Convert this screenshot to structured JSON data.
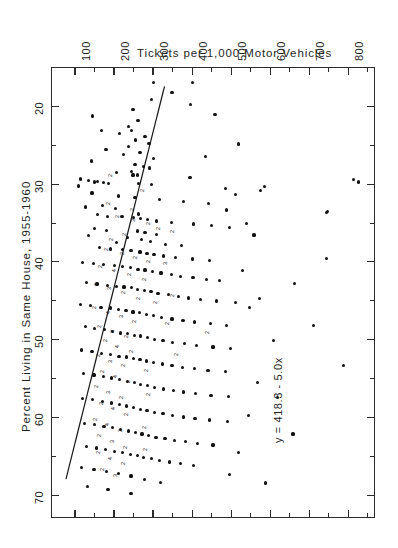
{
  "figure": {
    "orientation": "rotated-90",
    "background_color": "#ffffff",
    "ink_color": "#111111"
  },
  "chart_data": {
    "type": "scatter",
    "title": "Tickets per 1,000 Motor Vehicles",
    "xlabel": "Percent Living in Same House, 1955-1960",
    "ylabel": "Tickets per 1,000 Motor Vehicles",
    "annotation": "y = 418.3 - 5.0x",
    "grid": false,
    "legend": null,
    "xlim": [
      15,
      73
    ],
    "ylim": [
      40,
      870
    ],
    "x_ticks": [
      20,
      30,
      40,
      50,
      60,
      70
    ],
    "x_tick_labels": [
      "20",
      "30",
      "40",
      "50",
      "60",
      "70"
    ],
    "y_ticks": [
      100,
      200,
      300,
      400,
      500,
      600,
      700,
      800
    ],
    "y_tick_labels": [
      "100",
      "200",
      "300",
      "400",
      "500",
      "600",
      "700",
      "800"
    ],
    "minor_ticks_y": [
      150,
      250,
      350,
      450,
      550,
      650,
      750,
      850
    ],
    "regression": {
      "equation": "y = 418.3 - 5.0x",
      "intercept": 418.3,
      "slope": -5.0,
      "x_start": 17.5,
      "x_end": 68.0
    },
    "points": [
      [
        17.0,
        303
      ],
      [
        17.0,
        403
      ],
      [
        18.3,
        350
      ],
      [
        19.2,
        297
      ],
      [
        19.8,
        398
      ],
      [
        20.5,
        250
      ],
      [
        21.3,
        147
      ],
      [
        21.9,
        263
      ],
      [
        22.6,
        238
      ],
      [
        23.2,
        170
      ],
      [
        23.2,
        247
      ],
      [
        23.6,
        215
      ],
      [
        23.9,
        281
      ],
      [
        24.4,
        256
      ],
      [
        24.8,
        291
      ],
      [
        25.2,
        238
      ],
      [
        25.6,
        181
      ],
      [
        26.0,
        268
      ],
      [
        26.3,
        225
      ],
      [
        26.8,
        303
      ],
      [
        27.1,
        143
      ],
      [
        27.5,
        255
      ],
      [
        27.8,
        278
      ],
      [
        28.0,
        292
      ],
      [
        28.4,
        247
      ],
      [
        28.6,
        207
      ],
      [
        28.9,
        250
      ],
      [
        28.9,
        262
      ],
      [
        29.2,
        396
      ],
      [
        29.4,
        116
      ],
      [
        29.6,
        136
      ],
      [
        29.7,
        160
      ],
      [
        29.8,
        151
      ],
      [
        29.9,
        174
      ],
      [
        30.0,
        188
      ],
      [
        30.0,
        264
      ],
      [
        30.1,
        298
      ],
      [
        30.3,
        110
      ],
      [
        30.6,
        486
      ],
      [
        30.9,
        576
      ],
      [
        31.2,
        145
      ],
      [
        31.6,
        213
      ],
      [
        31.8,
        255
      ],
      [
        32.0,
        318
      ],
      [
        32.3,
        380
      ],
      [
        32.6,
        444
      ],
      [
        32.8,
        172
      ],
      [
        33.0,
        128
      ],
      [
        33.2,
        205
      ],
      [
        33.4,
        490
      ],
      [
        33.7,
        745
      ],
      [
        33.9,
        265
      ],
      [
        34.0,
        160
      ],
      [
        34.2,
        185
      ],
      [
        34.2,
        222
      ],
      [
        34.4,
        252
      ],
      [
        34.5,
        269
      ],
      [
        34.6,
        288
      ],
      [
        34.8,
        311
      ],
      [
        35.0,
        348
      ],
      [
        35.2,
        405
      ],
      [
        35.4,
        452
      ],
      [
        35.6,
        498
      ],
      [
        35.8,
        152
      ],
      [
        36.0,
        182
      ],
      [
        36.1,
        262
      ],
      [
        36.3,
        281
      ],
      [
        36.5,
        310
      ],
      [
        36.7,
        137
      ],
      [
        36.9,
        237
      ],
      [
        37.2,
        271
      ],
      [
        37.4,
        295
      ],
      [
        37.6,
        208
      ],
      [
        37.8,
        333
      ],
      [
        38.0,
        375
      ],
      [
        38.2,
        165
      ],
      [
        38.4,
        193
      ],
      [
        38.5,
        224
      ],
      [
        38.6,
        245
      ],
      [
        38.8,
        268
      ],
      [
        39.0,
        286
      ],
      [
        39.1,
        304
      ],
      [
        39.3,
        329
      ],
      [
        39.5,
        358
      ],
      [
        39.7,
        402
      ],
      [
        39.9,
        447
      ],
      [
        40.1,
        121
      ],
      [
        40.3,
        148
      ],
      [
        40.4,
        175
      ],
      [
        40.5,
        202
      ],
      [
        40.7,
        223
      ],
      [
        40.8,
        244
      ],
      [
        41.0,
        263
      ],
      [
        41.1,
        281
      ],
      [
        41.3,
        300
      ],
      [
        41.5,
        322
      ],
      [
        41.7,
        348
      ],
      [
        41.9,
        371
      ],
      [
        42.1,
        404
      ],
      [
        42.3,
        438
      ],
      [
        42.5,
        471
      ],
      [
        42.7,
        131
      ],
      [
        42.9,
        158
      ],
      [
        43.1,
        184
      ],
      [
        43.2,
        208
      ],
      [
        43.3,
        227
      ],
      [
        43.4,
        246
      ],
      [
        43.6,
        262
      ],
      [
        43.7,
        279
      ],
      [
        43.9,
        296
      ],
      [
        44.1,
        314
      ],
      [
        44.3,
        340
      ],
      [
        44.5,
        366
      ],
      [
        44.7,
        392
      ],
      [
        44.9,
        424
      ],
      [
        45.1,
        463
      ],
      [
        45.3,
        512
      ],
      [
        45.5,
        115
      ],
      [
        45.7,
        142
      ],
      [
        45.9,
        168
      ],
      [
        46.0,
        192
      ],
      [
        46.2,
        212
      ],
      [
        46.3,
        232
      ],
      [
        46.5,
        250
      ],
      [
        46.6,
        267
      ],
      [
        46.8,
        284
      ],
      [
        47.0,
        302
      ],
      [
        47.2,
        324
      ],
      [
        47.4,
        350
      ],
      [
        47.6,
        378
      ],
      [
        47.8,
        408
      ],
      [
        48.0,
        448
      ],
      [
        48.2,
        490
      ],
      [
        48.4,
        128
      ],
      [
        48.6,
        152
      ],
      [
        48.8,
        177
      ],
      [
        49.0,
        198
      ],
      [
        49.2,
        218
      ],
      [
        49.3,
        236
      ],
      [
        49.5,
        254
      ],
      [
        49.6,
        270
      ],
      [
        49.8,
        287
      ],
      [
        50.0,
        305
      ],
      [
        50.2,
        327
      ],
      [
        50.4,
        352
      ],
      [
        50.6,
        381
      ],
      [
        50.8,
        412
      ],
      [
        51.0,
        455
      ],
      [
        51.2,
        500
      ],
      [
        51.4,
        118
      ],
      [
        51.6,
        145
      ],
      [
        51.8,
        170
      ],
      [
        52.0,
        193
      ],
      [
        52.2,
        214
      ],
      [
        52.3,
        233
      ],
      [
        52.5,
        251
      ],
      [
        52.6,
        268
      ],
      [
        52.8,
        285
      ],
      [
        53.0,
        303
      ],
      [
        53.2,
        325
      ],
      [
        53.4,
        350
      ],
      [
        53.6,
        377
      ],
      [
        53.8,
        407
      ],
      [
        54.0,
        442
      ],
      [
        54.2,
        487
      ],
      [
        54.4,
        124
      ],
      [
        54.6,
        150
      ],
      [
        54.8,
        174
      ],
      [
        55.0,
        196
      ],
      [
        55.2,
        216
      ],
      [
        55.4,
        235
      ],
      [
        55.6,
        253
      ],
      [
        55.8,
        270
      ],
      [
        56.0,
        287
      ],
      [
        56.2,
        306
      ],
      [
        56.4,
        328
      ],
      [
        56.6,
        353
      ],
      [
        56.8,
        380
      ],
      [
        57.0,
        410
      ],
      [
        57.2,
        450
      ],
      [
        57.4,
        495
      ],
      [
        57.6,
        120
      ],
      [
        57.8,
        146
      ],
      [
        58.0,
        171
      ],
      [
        58.2,
        194
      ],
      [
        58.4,
        215
      ],
      [
        58.6,
        234
      ],
      [
        58.8,
        252
      ],
      [
        59.0,
        269
      ],
      [
        59.2,
        286
      ],
      [
        59.4,
        305
      ],
      [
        59.6,
        327
      ],
      [
        59.8,
        352
      ],
      [
        60.0,
        379
      ],
      [
        60.2,
        409
      ],
      [
        60.4,
        447
      ],
      [
        60.6,
        492
      ],
      [
        60.8,
        126
      ],
      [
        61.0,
        151
      ],
      [
        61.2,
        176
      ],
      [
        61.4,
        198
      ],
      [
        61.6,
        219
      ],
      [
        61.8,
        238
      ],
      [
        62.0,
        256
      ],
      [
        62.2,
        273
      ],
      [
        62.4,
        290
      ],
      [
        62.6,
        309
      ],
      [
        62.8,
        332
      ],
      [
        63.0,
        357
      ],
      [
        63.2,
        385
      ],
      [
        63.4,
        416
      ],
      [
        63.6,
        455
      ],
      [
        63.8,
        130
      ],
      [
        64.0,
        156
      ],
      [
        64.2,
        180
      ],
      [
        64.4,
        203
      ],
      [
        64.6,
        224
      ],
      [
        64.8,
        243
      ],
      [
        65.0,
        261
      ],
      [
        65.2,
        278
      ],
      [
        65.4,
        297
      ],
      [
        65.6,
        318
      ],
      [
        65.8,
        344
      ],
      [
        66.0,
        372
      ],
      [
        66.2,
        406
      ],
      [
        66.5,
        118
      ],
      [
        66.8,
        150
      ],
      [
        67.0,
        183
      ],
      [
        67.3,
        212
      ],
      [
        67.6,
        245
      ],
      [
        68.0,
        280
      ],
      [
        68.4,
        320
      ],
      [
        68.9,
        134
      ],
      [
        69.3,
        186
      ],
      [
        69.8,
        245
      ],
      [
        29.5,
        815
      ],
      [
        29.8,
        828
      ],
      [
        33.6,
        748
      ],
      [
        39.6,
        745
      ],
      [
        42.8,
        663
      ],
      [
        48.2,
        712
      ],
      [
        53.4,
        790
      ],
      [
        57.5,
        620
      ],
      [
        62.2,
        660
      ],
      [
        68.5,
        590
      ],
      [
        30.4,
        586
      ],
      [
        36.6,
        560
      ],
      [
        44.8,
        575
      ],
      [
        50.2,
        610
      ],
      [
        55.6,
        568
      ],
      [
        59.8,
        545
      ],
      [
        64.6,
        520
      ],
      [
        67.4,
        498
      ],
      [
        21.1,
        460
      ],
      [
        24.9,
        520
      ],
      [
        26.5,
        436
      ],
      [
        31.4,
        512
      ],
      [
        35.1,
        540
      ],
      [
        41.2,
        530
      ],
      [
        45.9,
        548
      ]
    ],
    "multiplicity_markers": [
      {
        "x": 28.8,
        "y": 172,
        "label": "2"
      },
      {
        "x": 32.4,
        "y": 168,
        "label": "2"
      },
      {
        "x": 34.1,
        "y": 190,
        "label": "2"
      },
      {
        "x": 34.6,
        "y": 230,
        "label": "3"
      },
      {
        "x": 35.0,
        "y": 268,
        "label": "2"
      },
      {
        "x": 35.6,
        "y": 295,
        "label": "2"
      },
      {
        "x": 36.4,
        "y": 208,
        "label": "2"
      },
      {
        "x": 37.0,
        "y": 175,
        "label": "2"
      },
      {
        "x": 38.4,
        "y": 161,
        "label": "2"
      },
      {
        "x": 38.9,
        "y": 202,
        "label": "2"
      },
      {
        "x": 39.4,
        "y": 236,
        "label": "2"
      },
      {
        "x": 39.9,
        "y": 268,
        "label": "2"
      },
      {
        "x": 40.5,
        "y": 147,
        "label": "2"
      },
      {
        "x": 41.0,
        "y": 182,
        "label": "4"
      },
      {
        "x": 41.6,
        "y": 221,
        "label": "2"
      },
      {
        "x": 42.2,
        "y": 258,
        "label": "2"
      },
      {
        "x": 42.8,
        "y": 135,
        "label": "2"
      },
      {
        "x": 43.4,
        "y": 170,
        "label": "3"
      },
      {
        "x": 43.9,
        "y": 206,
        "label": "2"
      },
      {
        "x": 44.6,
        "y": 243,
        "label": "2"
      },
      {
        "x": 45.2,
        "y": 288,
        "label": "2"
      },
      {
        "x": 45.8,
        "y": 132,
        "label": "2"
      },
      {
        "x": 46.4,
        "y": 166,
        "label": "4"
      },
      {
        "x": 47.0,
        "y": 200,
        "label": "3"
      },
      {
        "x": 47.6,
        "y": 234,
        "label": "2"
      },
      {
        "x": 48.3,
        "y": 144,
        "label": "2"
      },
      {
        "x": 48.9,
        "y": 178,
        "label": "3"
      },
      {
        "x": 49.5,
        "y": 212,
        "label": "2"
      },
      {
        "x": 50.1,
        "y": 158,
        "label": "2"
      },
      {
        "x": 50.8,
        "y": 190,
        "label": "4"
      },
      {
        "x": 51.4,
        "y": 225,
        "label": "2"
      },
      {
        "x": 52.0,
        "y": 140,
        "label": "2"
      },
      {
        "x": 52.7,
        "y": 172,
        "label": "3"
      },
      {
        "x": 53.3,
        "y": 204,
        "label": "2"
      },
      {
        "x": 54.0,
        "y": 152,
        "label": "2"
      },
      {
        "x": 54.7,
        "y": 186,
        "label": "4"
      },
      {
        "x": 55.3,
        "y": 218,
        "label": "2"
      },
      {
        "x": 56.0,
        "y": 136,
        "label": "2"
      },
      {
        "x": 56.7,
        "y": 168,
        "label": "3"
      },
      {
        "x": 57.4,
        "y": 200,
        "label": "2"
      },
      {
        "x": 58.1,
        "y": 148,
        "label": "2"
      },
      {
        "x": 58.8,
        "y": 180,
        "label": "4"
      },
      {
        "x": 59.5,
        "y": 214,
        "label": "2"
      },
      {
        "x": 60.2,
        "y": 133,
        "label": "2"
      },
      {
        "x": 60.9,
        "y": 165,
        "label": "4"
      },
      {
        "x": 61.6,
        "y": 198,
        "label": "2"
      },
      {
        "x": 62.3,
        "y": 145,
        "label": "2"
      },
      {
        "x": 63.0,
        "y": 176,
        "label": "3"
      },
      {
        "x": 63.8,
        "y": 210,
        "label": "2"
      },
      {
        "x": 64.5,
        "y": 140,
        "label": "2"
      },
      {
        "x": 65.2,
        "y": 172,
        "label": "4"
      },
      {
        "x": 65.9,
        "y": 205,
        "label": "2"
      },
      {
        "x": 66.6,
        "y": 152,
        "label": "2"
      },
      {
        "x": 67.4,
        "y": 186,
        "label": "3"
      },
      {
        "x": 44.2,
        "y": 332,
        "label": "2"
      },
      {
        "x": 47.9,
        "y": 318,
        "label": "2"
      },
      {
        "x": 51.8,
        "y": 340,
        "label": "2"
      },
      {
        "x": 40.2,
        "y": 312,
        "label": "3"
      },
      {
        "x": 36.0,
        "y": 330,
        "label": "2"
      },
      {
        "x": 30.7,
        "y": 255,
        "label": "2"
      },
      {
        "x": 33.2,
        "y": 228,
        "label": "2"
      },
      {
        "x": 49.0,
        "y": 420,
        "label": "2"
      },
      {
        "x": 53.9,
        "y": 265,
        "label": "2"
      },
      {
        "x": 57.0,
        "y": 268,
        "label": "2"
      },
      {
        "x": 61.2,
        "y": 258,
        "label": "2"
      },
      {
        "x": 64.0,
        "y": 262,
        "label": "2"
      }
    ]
  },
  "axes": {
    "top_axis": {
      "title": "Tickets per 1,000 Motor Vehicles",
      "labels": [
        "100",
        "200",
        "300",
        "400",
        "500",
        "600",
        "700",
        "800"
      ]
    },
    "left_axis": {
      "title": "Percent Living in Same House, 1955-1960",
      "labels": [
        "20",
        "30",
        "40",
        "50",
        "60",
        "70"
      ]
    }
  },
  "annotation": {
    "equation": "y = 418.3 - 5.0x"
  }
}
